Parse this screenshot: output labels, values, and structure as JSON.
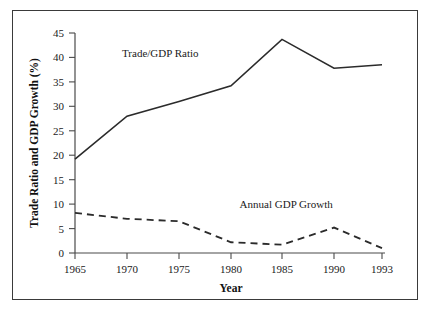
{
  "chart_data": {
    "type": "line",
    "title": "",
    "xlabel": "Year",
    "ylabel": "Trade Ratio and GDP Growth (%)",
    "x": [
      1965,
      1970,
      1975,
      1980,
      1985,
      1990,
      1993
    ],
    "xtick_labels": [
      "1965",
      "1970",
      "1975",
      "1980",
      "1985",
      "1990",
      "1993"
    ],
    "ytick_labels": [
      "0",
      "5",
      "10",
      "15",
      "20",
      "25",
      "30",
      "35",
      "40",
      "45"
    ],
    "ytick_values": [
      0,
      5,
      10,
      15,
      20,
      25,
      30,
      35,
      40,
      45
    ],
    "ylim": [
      0,
      45
    ],
    "xlim": [
      1965,
      1993
    ],
    "grid": false,
    "legend_position": "inline-annotations",
    "series": [
      {
        "name": "Trade/GDP Ratio",
        "style": "solid",
        "values": [
          19.2,
          28.0,
          31.0,
          34.2,
          43.7,
          37.8,
          38.5
        ]
      },
      {
        "name": "Annual GDP Growth",
        "style": "dashed",
        "values": [
          8.2,
          7.0,
          6.5,
          2.2,
          1.7,
          5.2,
          1.0
        ]
      }
    ],
    "annotations": [
      {
        "text": "Trade/GDP Ratio",
        "x": 1973.2,
        "y": 40.0
      },
      {
        "text": "Annual GDP Growth",
        "x": 1985.4,
        "y": 9.2
      }
    ]
  },
  "colors": {
    "line": "#2b2b2b",
    "axis": "#4a4a4a",
    "frame": "#3a3a3a",
    "background": "#ffffff",
    "text": "#1a1a1a"
  }
}
